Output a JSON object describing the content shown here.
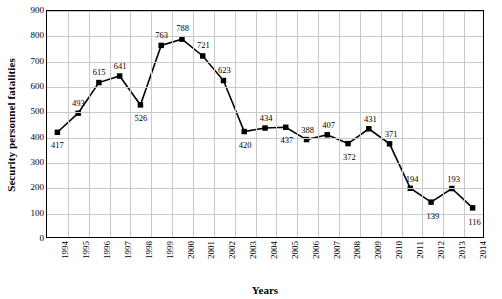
{
  "chart_data": {
    "type": "line",
    "title": "",
    "xlabel": "Years",
    "ylabel": "Security personnel fatalities",
    "categories": [
      "1994",
      "1995",
      "1996",
      "1997",
      "1998",
      "1999",
      "2000",
      "2001",
      "2002",
      "2003",
      "2004",
      "2005",
      "2006",
      "2007",
      "2008",
      "2009",
      "2010",
      "2011",
      "2012",
      "2013",
      "2014"
    ],
    "values": [
      417,
      493,
      615,
      641,
      526,
      763,
      788,
      721,
      623,
      420,
      434,
      437,
      388,
      407,
      372,
      431,
      371,
      194,
      139,
      193,
      116
    ],
    "ylim": [
      0,
      900
    ],
    "yticks": [
      0,
      100,
      200,
      300,
      400,
      500,
      600,
      700,
      800,
      900
    ],
    "grid": true,
    "legend": "none",
    "series_color": "#000000",
    "marker": "square",
    "label_positions": [
      "below",
      "above",
      "above",
      "above",
      "below",
      "above",
      "above",
      "above",
      "above",
      "below",
      "above",
      "below",
      "above",
      "above",
      "below",
      "above",
      "above",
      "above",
      "below",
      "above",
      "below"
    ]
  }
}
